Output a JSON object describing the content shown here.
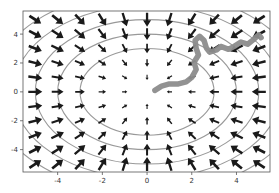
{
  "chart_data": {
    "type": "quiver",
    "title": "",
    "xlabel": "",
    "ylabel": "",
    "xlim": [
      -5.55,
      5.5
    ],
    "ylim": [
      -5.55,
      5.6
    ],
    "grid": false,
    "xticks": [
      -4,
      -2,
      0,
      2,
      4
    ],
    "yticks": [
      -4,
      -2,
      0,
      2,
      4
    ],
    "xtick_labels": [
      "-4",
      "-2",
      "0",
      "2",
      "4"
    ],
    "ytick_labels": [
      "4",
      "2",
      "0",
      "-2",
      "-4"
    ],
    "ytick_values": [
      4,
      2,
      0,
      -2,
      -4
    ],
    "vector_field": {
      "description": "field points toward origin: (u, v) = (-x, -y)",
      "x_values": [
        -5,
        -4,
        -3,
        -2,
        -1,
        0,
        1,
        2,
        3,
        4,
        5
      ],
      "y_values": [
        -5,
        -4,
        -3,
        -2,
        -1,
        0,
        1,
        2,
        3,
        4,
        5
      ],
      "color": "#1a1a1a"
    },
    "contours": {
      "description": "concentric circles x^2 + y^2 = r^2",
      "radii": [
        3,
        4,
        5,
        6,
        7
      ],
      "color": "#999999"
    },
    "trajectory": {
      "color": "#8c8c8c",
      "points": [
        [
          0.35,
          0.1
        ],
        [
          0.65,
          0.4
        ],
        [
          1.0,
          0.55
        ],
        [
          1.4,
          0.55
        ],
        [
          1.75,
          0.7
        ],
        [
          2.0,
          1.0
        ],
        [
          2.2,
          1.55
        ],
        [
          2.1,
          2.05
        ],
        [
          2.3,
          2.55
        ],
        [
          2.2,
          3.0
        ],
        [
          2.15,
          3.55
        ],
        [
          2.35,
          3.85
        ],
        [
          2.55,
          3.55
        ],
        [
          2.65,
          3.05
        ],
        [
          2.8,
          2.75
        ],
        [
          3.1,
          2.9
        ],
        [
          3.3,
          3.15
        ],
        [
          3.65,
          2.95
        ],
        [
          3.9,
          3.15
        ],
        [
          4.2,
          3.45
        ],
        [
          4.5,
          3.3
        ],
        [
          4.75,
          3.6
        ],
        [
          5.0,
          3.95
        ],
        [
          5.1,
          3.75
        ]
      ]
    }
  }
}
